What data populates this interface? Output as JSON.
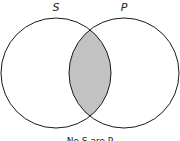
{
  "diagram": {
    "type": "venn",
    "sets": [
      {
        "label": "S"
      },
      {
        "label": "P"
      }
    ],
    "shaded_region": "intersection",
    "caption": "No S are P",
    "colors": {
      "stroke": "#1a1a1a",
      "shade": "#c2c2c2",
      "background": "#ffffff"
    }
  }
}
